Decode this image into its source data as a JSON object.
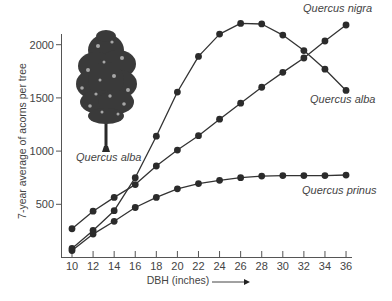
{
  "chart_data": {
    "type": "line",
    "title": "",
    "xlabel": "DBH (inches)",
    "ylabel": "7-year average of acorns per tree",
    "x": [
      10,
      12,
      14,
      16,
      18,
      20,
      22,
      24,
      26,
      28,
      30,
      32,
      34,
      36
    ],
    "xticks": [
      "10",
      "12",
      "14",
      "16",
      "18",
      "20",
      "22",
      "24",
      "26",
      "28",
      "30",
      "32",
      "34",
      "36"
    ],
    "yticks": [
      "500",
      "1000",
      "1500",
      "2000"
    ],
    "xlim": [
      10,
      36
    ],
    "ylim": [
      0,
      2100
    ],
    "grid": false,
    "legend": "direct labels on lines",
    "series": [
      {
        "name": "Quercus nigra",
        "values": [
          270,
          435,
          565,
          685,
          860,
          1010,
          1145,
          1300,
          1450,
          1600,
          1740,
          1875,
          2035,
          2185
        ]
      },
      {
        "name": "Quercus alba",
        "values": [
          85,
          255,
          440,
          750,
          1140,
          1555,
          1890,
          2100,
          2200,
          2195,
          2090,
          1945,
          1770,
          1570
        ]
      },
      {
        "name": "Quercus prinus",
        "values": [
          65,
          220,
          340,
          470,
          565,
          645,
          695,
          725,
          750,
          765,
          770,
          770,
          770,
          775
        ]
      }
    ],
    "annotations": [
      "Quercus alba (tree illustration)"
    ]
  },
  "labels": {
    "nigra": "Quercus nigra",
    "alba": "Quercus alba",
    "prinus": "Quercus prinus",
    "tree": "Quercus alba"
  }
}
